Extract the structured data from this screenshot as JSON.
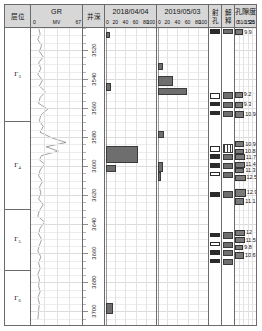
{
  "columns": {
    "stratum": {
      "title": "层位"
    },
    "gr": {
      "title": "GR",
      "unit": "MV",
      "min": "0",
      "max": "67"
    },
    "depth": {
      "title": "井深"
    },
    "log2018": {
      "title": "2018/04/04",
      "ticks": [
        "0",
        "20",
        "40",
        "60",
        "80",
        "100"
      ]
    },
    "log2019": {
      "title": "2019/05/03",
      "ticks": [
        "0",
        "20",
        "40",
        "60",
        "80",
        "100"
      ]
    },
    "perforation": {
      "title_line1": "射",
      "title_line2": "孔"
    },
    "interpretation": {
      "title_line1": "解",
      "title_line2": "释"
    },
    "porosity": {
      "title": "孔隙度",
      "ticks": [
        "0",
        "5",
        "10",
        "15",
        "20",
        "25"
      ]
    }
  },
  "stratum_rows": [
    {
      "label": "Γ",
      "sub": "3"
    },
    {
      "label": "Γ",
      "sub": "4"
    },
    {
      "label": "Γ",
      "sub": "5"
    },
    {
      "label": "Γ",
      "sub": "6"
    }
  ],
  "depth_labels": [
    "3520",
    "3540",
    "3560",
    "3580",
    "3600",
    "3620",
    "3640",
    "3660",
    "3680",
    "3700"
  ],
  "chart_data": {
    "type": "table",
    "ylabel": "井深 (m)",
    "ylim": [
      3505,
      3710
    ],
    "grid": true,
    "tracks": [
      {
        "name": "GR",
        "type": "line",
        "unit": "MV",
        "xlim": [
          0,
          67
        ],
        "points": [
          [
            3505,
            10
          ],
          [
            3509,
            12
          ],
          [
            3513,
            9
          ],
          [
            3517,
            14
          ],
          [
            3521,
            11
          ],
          [
            3525,
            16
          ],
          [
            3529,
            10
          ],
          [
            3533,
            13
          ],
          [
            3537,
            9
          ],
          [
            3541,
            15
          ],
          [
            3545,
            11
          ],
          [
            3549,
            19
          ],
          [
            3553,
            12
          ],
          [
            3557,
            10
          ],
          [
            3561,
            22
          ],
          [
            3565,
            13
          ],
          [
            3569,
            11
          ],
          [
            3573,
            16
          ],
          [
            3577,
            12
          ],
          [
            3581,
            28
          ],
          [
            3584,
            46
          ],
          [
            3587,
            20
          ],
          [
            3590,
            36
          ],
          [
            3593,
            14
          ],
          [
            3596,
            11
          ],
          [
            3599,
            18
          ],
          [
            3603,
            12
          ],
          [
            3607,
            10
          ],
          [
            3611,
            15
          ],
          [
            3615,
            11
          ],
          [
            3619,
            13
          ],
          [
            3623,
            10
          ],
          [
            3627,
            16
          ],
          [
            3631,
            11
          ],
          [
            3635,
            9
          ],
          [
            3639,
            18
          ],
          [
            3643,
            12
          ],
          [
            3647,
            10
          ],
          [
            3651,
            14
          ],
          [
            3655,
            11
          ],
          [
            3659,
            9
          ],
          [
            3663,
            13
          ],
          [
            3667,
            10
          ],
          [
            3671,
            12
          ],
          [
            3675,
            9
          ],
          [
            3679,
            11
          ],
          [
            3683,
            10
          ],
          [
            3687,
            12
          ],
          [
            3691,
            9
          ],
          [
            3695,
            11
          ],
          [
            3700,
            10
          ],
          [
            3706,
            9
          ]
        ]
      },
      {
        "name": "2018/04/04",
        "type": "bar",
        "xlim": [
          0,
          100
        ],
        "bars": [
          {
            "depth": 3510,
            "top": 3508,
            "bottom": 3512,
            "value": 8
          },
          {
            "depth": 3545,
            "top": 3543,
            "bottom": 3548,
            "value": 10
          },
          {
            "depth": 3592,
            "top": 3586,
            "bottom": 3598,
            "value": 62
          },
          {
            "depth": 3601,
            "top": 3599,
            "bottom": 3604,
            "value": 20
          },
          {
            "depth": 3698,
            "top": 3694,
            "bottom": 3702,
            "value": 14
          }
        ]
      },
      {
        "name": "2019/05/03",
        "type": "bar",
        "xlim": [
          0,
          100
        ],
        "bars": [
          {
            "depth": 3531,
            "top": 3529,
            "bottom": 3534,
            "value": 10
          },
          {
            "depth": 3541,
            "top": 3538,
            "bottom": 3545,
            "value": 30
          },
          {
            "depth": 3548,
            "top": 3546,
            "bottom": 3551,
            "value": 56
          },
          {
            "depth": 3578,
            "top": 3576,
            "bottom": 3581,
            "value": 12
          },
          {
            "depth": 3600,
            "top": 3597,
            "bottom": 3604,
            "value": 9
          },
          {
            "depth": 3606,
            "top": 3604,
            "bottom": 3610,
            "value": 6
          }
        ]
      },
      {
        "name": "射孔",
        "type": "intervals",
        "intervals": [
          {
            "top": 3506,
            "bottom": 3509
          },
          {
            "top": 3550,
            "bottom": 3554
          },
          {
            "top": 3556,
            "bottom": 3559
          },
          {
            "top": 3562,
            "bottom": 3565
          },
          {
            "top": 3586,
            "bottom": 3590
          },
          {
            "top": 3592,
            "bottom": 3595
          },
          {
            "top": 3598,
            "bottom": 3601
          },
          {
            "top": 3604,
            "bottom": 3607
          },
          {
            "top": 3618,
            "bottom": 3621
          },
          {
            "top": 3646,
            "bottom": 3649
          },
          {
            "top": 3652,
            "bottom": 3655
          },
          {
            "top": 3658,
            "bottom": 3661
          },
          {
            "top": 3664,
            "bottom": 3667
          }
        ]
      },
      {
        "name": "解释",
        "type": "intervals",
        "intervals": [
          {
            "top": 3506,
            "bottom": 3509,
            "style": "fill"
          },
          {
            "top": 3549,
            "bottom": 3554,
            "style": "fill"
          },
          {
            "top": 3556,
            "bottom": 3560,
            "style": "fill"
          },
          {
            "top": 3562,
            "bottom": 3566,
            "style": "fill"
          },
          {
            "top": 3585,
            "bottom": 3591,
            "style": "hatch"
          },
          {
            "top": 3592,
            "bottom": 3596,
            "style": "fill"
          },
          {
            "top": 3598,
            "bottom": 3602,
            "style": "fill"
          },
          {
            "top": 3604,
            "bottom": 3608,
            "style": "fill"
          },
          {
            "top": 3617,
            "bottom": 3622,
            "style": "fill"
          },
          {
            "top": 3645,
            "bottom": 3650,
            "style": "fill"
          },
          {
            "top": 3652,
            "bottom": 3656,
            "style": "fill"
          },
          {
            "top": 3658,
            "bottom": 3662,
            "style": "fill"
          },
          {
            "top": 3664,
            "bottom": 3668,
            "style": "fill"
          }
        ]
      },
      {
        "name": "孔隙度",
        "type": "bar",
        "xlim": [
          0,
          25
        ],
        "bars": [
          {
            "top": 3506,
            "bottom": 3510,
            "value": 9.9,
            "label": "9.9"
          },
          {
            "top": 3549,
            "bottom": 3553,
            "value": 9.2,
            "label": "9.2"
          },
          {
            "top": 3556,
            "bottom": 3560,
            "value": 9.3,
            "label": "9.3"
          },
          {
            "top": 3562,
            "bottom": 3567,
            "value": 10.9,
            "label": "10.9"
          },
          {
            "top": 3583,
            "bottom": 3587,
            "value": 10.9,
            "label": "10.9"
          },
          {
            "top": 3588,
            "bottom": 3592,
            "value": 10.8,
            "label": "10.8"
          },
          {
            "top": 3592,
            "bottom": 3596,
            "value": 11.7,
            "label": "11.7"
          },
          {
            "top": 3597,
            "bottom": 3601,
            "value": 11.4,
            "label": "11.4"
          },
          {
            "top": 3601,
            "bottom": 3605,
            "value": 11.3,
            "label": "11.3"
          },
          {
            "top": 3606,
            "bottom": 3610,
            "value": 12.5,
            "label": "12.5"
          },
          {
            "top": 3616,
            "bottom": 3621,
            "value": 12.9,
            "label": "12.9"
          },
          {
            "top": 3622,
            "bottom": 3627,
            "value": 11.1,
            "label": "11.1"
          },
          {
            "top": 3644,
            "bottom": 3648,
            "value": 12.0,
            "label": "12"
          },
          {
            "top": 3649,
            "bottom": 3653,
            "value": 11.5,
            "label": "11.5"
          },
          {
            "top": 3654,
            "bottom": 3658,
            "value": 9.8,
            "label": "9.8"
          },
          {
            "top": 3659,
            "bottom": 3664,
            "value": 10.6,
            "label": "10.6"
          }
        ]
      }
    ]
  }
}
